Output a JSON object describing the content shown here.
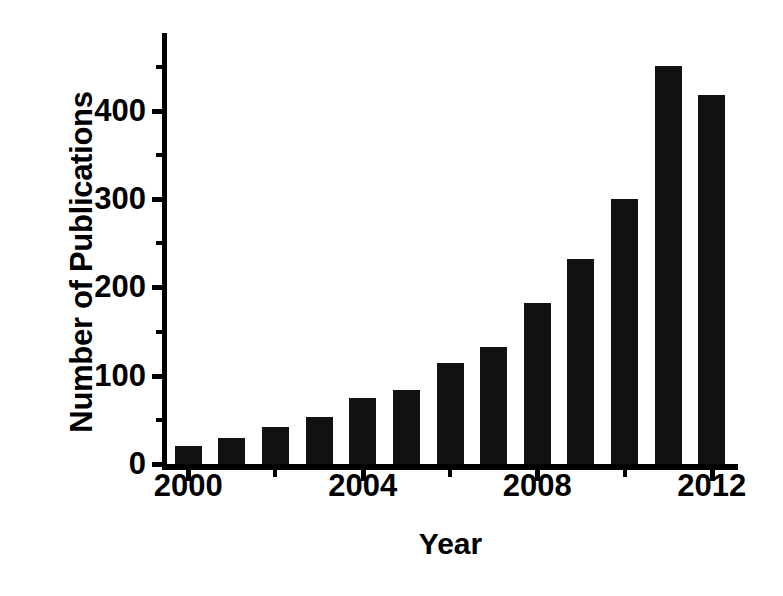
{
  "chart_data": {
    "type": "bar",
    "title": "",
    "xlabel": "Year",
    "ylabel": "Number of Publications",
    "categories": [
      "2000",
      "2001",
      "2002",
      "2003",
      "2004",
      "2005",
      "2006",
      "2007",
      "2008",
      "2009",
      "2010",
      "2011",
      "2012"
    ],
    "values": [
      20,
      29,
      42,
      53,
      75,
      84,
      114,
      132,
      182,
      232,
      300,
      451,
      418
    ],
    "series": [
      {
        "name": "Number of Publications",
        "values": [
          20,
          29,
          42,
          53,
          75,
          84,
          114,
          132,
          182,
          232,
          300,
          451,
          418
        ]
      }
    ],
    "xlim": [
      1999.4,
      2012.6
    ],
    "ylim": [
      0,
      488
    ],
    "ytick_labels": [
      "0",
      "100",
      "200",
      "300",
      "400"
    ],
    "ytick_values": [
      0,
      100,
      200,
      300,
      400
    ],
    "yminor_values": [
      50,
      150,
      250,
      350,
      450
    ],
    "xtick_labels": [
      "2000",
      "2004",
      "2008",
      "2012"
    ],
    "xtick_values": [
      2000,
      2004,
      2008,
      2012
    ],
    "xminor_values": [
      2002,
      2006,
      2010
    ],
    "grid": false,
    "legend": false,
    "legend_position": "none",
    "bar_color": "#111111",
    "axis_color": "#000000",
    "background_color": "#ffffff"
  }
}
